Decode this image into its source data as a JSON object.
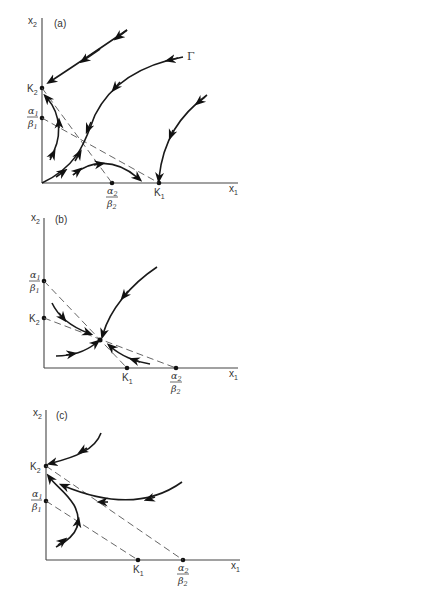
{
  "panels": [
    {
      "id": "a",
      "label": "(a)",
      "y_axis_label": "x",
      "y_axis_sub": "2",
      "x_axis_label": "x",
      "x_axis_sub": "1",
      "y_ticks": [
        {
          "name": "K",
          "sub": "2"
        },
        {
          "num": "α",
          "num_sub": "1",
          "den": "β",
          "den_sub": "1"
        }
      ],
      "x_ticks": [
        {
          "num": "α",
          "num_sub": "2",
          "den": "β",
          "den_sub": "2"
        },
        {
          "name": "K",
          "sub": "1"
        }
      ],
      "curve_label": "Γ"
    },
    {
      "id": "b",
      "label": "(b)",
      "y_axis_label": "x",
      "y_axis_sub": "2",
      "x_axis_label": "x",
      "x_axis_sub": "1",
      "y_ticks": [
        {
          "num": "α",
          "num_sub": "1",
          "den": "β",
          "den_sub": "1"
        },
        {
          "name": "K",
          "sub": "2"
        }
      ],
      "x_ticks": [
        {
          "name": "K",
          "sub": "1"
        },
        {
          "num": "α",
          "num_sub": "2",
          "den": "β",
          "den_sub": "2"
        }
      ]
    },
    {
      "id": "c",
      "label": "(c)",
      "y_axis_label": "x",
      "y_axis_sub": "2",
      "x_axis_label": "x",
      "x_axis_sub": "1",
      "y_ticks": [
        {
          "name": "K",
          "sub": "2"
        },
        {
          "num": "α",
          "num_sub": "1",
          "den": "β",
          "den_sub": "1"
        }
      ],
      "x_ticks": [
        {
          "name": "K",
          "sub": "1"
        },
        {
          "num": "α",
          "num_sub": "2",
          "den": "β",
          "den_sub": "2"
        }
      ]
    }
  ]
}
